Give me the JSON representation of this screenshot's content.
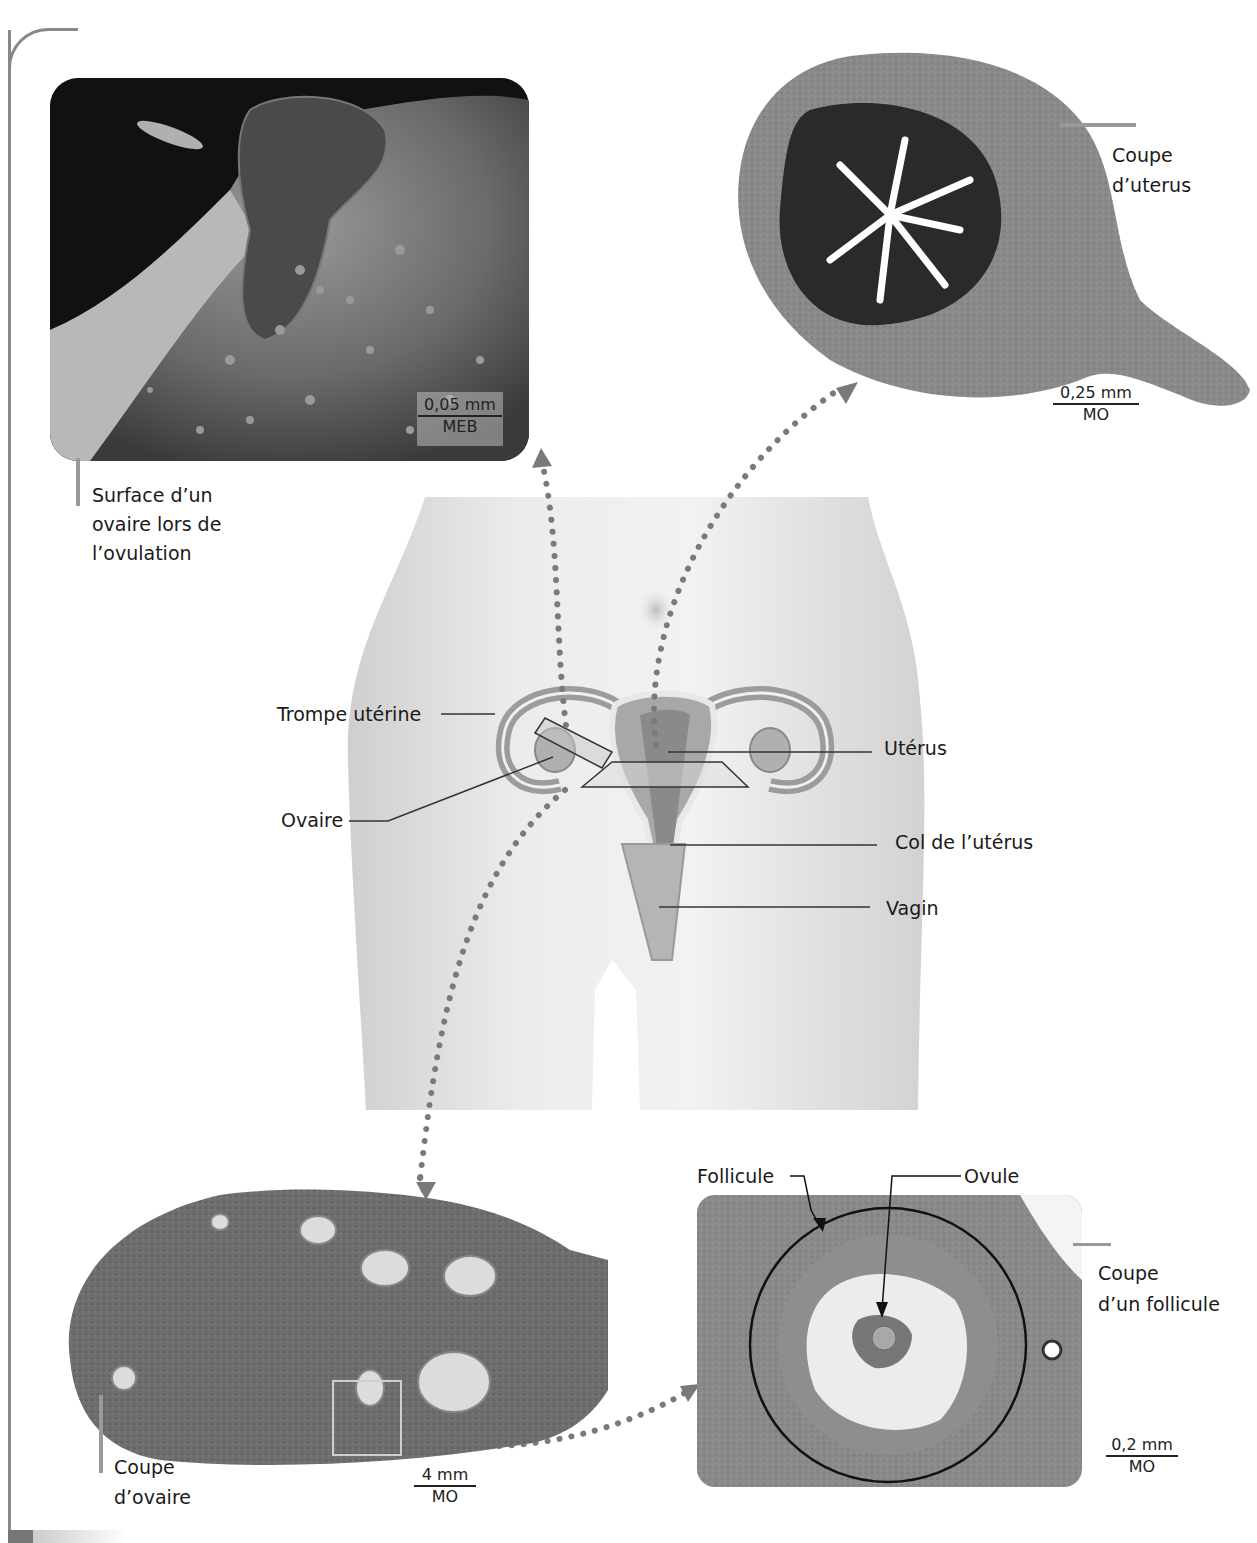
{
  "diagram": {
    "colors": {
      "frame": "#888888",
      "dots": "#7a7a7a",
      "body": "#e8e8e8",
      "organ": "#9a9a9a",
      "tissue_dark": "#5a5a5a"
    },
    "panels": {
      "ovary_surface": {
        "caption_lines": [
          "Surface d’un",
          "ovaire lors de",
          "l’ovulation"
        ],
        "scale_value": "0,05 mm",
        "scale_method": "MEB"
      },
      "uterus_section": {
        "caption_lines": [
          "Coupe",
          "d’uterus"
        ],
        "scale_value": "0,25 mm",
        "scale_method": "MO"
      },
      "ovary_section": {
        "caption_lines": [
          "Coupe",
          "d’ovaire"
        ],
        "scale_value": "4 mm",
        "scale_method": "MO"
      },
      "follicle_section": {
        "caption_lines": [
          "Coupe",
          "d’un follicule"
        ],
        "scale_value": "0,2 mm",
        "scale_method": "MO",
        "labels": {
          "follicle": "Follicule",
          "ovule": "Ovule"
        }
      }
    },
    "anatomy_labels": {
      "fallopian_tube": "Trompe utérine",
      "ovary": "Ovaire",
      "uterus": "Utérus",
      "cervix": "Col de l’utérus",
      "vagina": "Vagin"
    }
  }
}
